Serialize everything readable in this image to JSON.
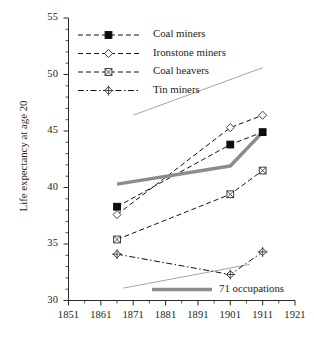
{
  "figure": {
    "title_cutoff": "",
    "ylabel": "Life expectancy at age 20"
  },
  "chart_data": {
    "type": "line",
    "title": "",
    "xlabel": "",
    "ylabel": "Life expectancy at age 20",
    "xlim": [
      1851,
      1921
    ],
    "ylim": [
      30,
      55
    ],
    "xticks": [
      1851,
      1861,
      1871,
      1881,
      1891,
      1901,
      1911,
      1921
    ],
    "yticks": [
      30,
      35,
      40,
      45,
      50,
      55
    ],
    "xtick_labels": [
      "1851",
      "1861",
      "1871",
      "1881",
      "1891",
      "1901",
      "1911",
      "1921"
    ],
    "ytick_labels": [
      "30",
      "35",
      "40",
      "45",
      "50",
      "55"
    ],
    "x_minor_step": 5,
    "y_minor_step": 1,
    "grid": false,
    "legend_position": "top-left",
    "x": [
      1866,
      1901,
      1911
    ],
    "series": [
      {
        "name": "Coal miners",
        "marker": "filled-square",
        "dash": "dashed",
        "color": "#111111",
        "x": [
          1866,
          1901,
          1911
        ],
        "values": [
          38.3,
          43.8,
          44.9
        ]
      },
      {
        "name": "Ironstone miners",
        "marker": "open-diamond",
        "dash": "dashed",
        "color": "#111111",
        "x": [
          1866,
          1901,
          1911
        ],
        "values": [
          37.6,
          45.3,
          46.4
        ]
      },
      {
        "name": "Coal heavers",
        "marker": "crossed-square",
        "dash": "dashed",
        "color": "#111111",
        "x": [
          1866,
          1901,
          1911
        ],
        "values": [
          35.4,
          39.4,
          41.5
        ]
      },
      {
        "name": "Tin miners",
        "marker": "plus-diamond",
        "dash": "dash-dot",
        "color": "#111111",
        "x": [
          1866,
          1901,
          1911
        ],
        "values": [
          34.1,
          32.3,
          34.3
        ]
      },
      {
        "name": "71 occupations",
        "marker": "none",
        "dash": "solid-thick",
        "color": "#8c8c8c",
        "x": [
          1866,
          1901,
          1911
        ],
        "values": [
          40.3,
          41.9,
          44.9
        ]
      }
    ],
    "reference_lines": [
      {
        "name": "upper-reference-line",
        "color": "#9a9a9a",
        "x": [
          1871,
          1911
        ],
        "values": [
          46.4,
          50.6
        ]
      },
      {
        "name": "lower-reference-line",
        "color": "#9a9a9a",
        "x": [
          1868,
          1907
        ],
        "values": [
          31.1,
          33.2
        ]
      }
    ],
    "annotations": []
  },
  "legend": {
    "entries": [
      {
        "label": "Coal miners",
        "marker": "filled-square-marker"
      },
      {
        "label": "Ironstone miners",
        "marker": "open-diamond-marker"
      },
      {
        "label": "Coal heavers",
        "marker": "crossed-square-marker"
      },
      {
        "label": "Tin miners",
        "marker": "plus-diamond-marker"
      }
    ],
    "inset": {
      "label": "71 occupations",
      "marker": "thick-gray-line-swatch"
    }
  }
}
